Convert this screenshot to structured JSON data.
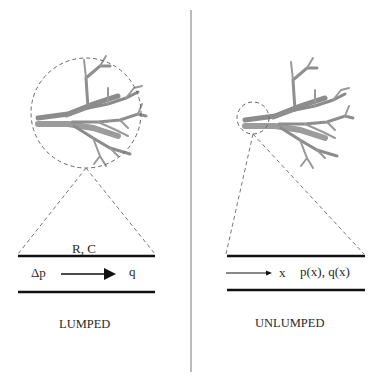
{
  "panels": {
    "lumped": {
      "title": "LUMPED",
      "tube_label": "R, C",
      "input_label": "Δp",
      "output_label": "q"
    },
    "unlumped": {
      "title": "UNLUMPED",
      "axis_label": "x",
      "variables_label": "p(x), q(x)"
    }
  },
  "icons": {
    "tree": "vascular-tree-illustration",
    "magnifier": "dashed-zoom-circle"
  },
  "colors": {
    "line": "#111111",
    "dashed": "#666666",
    "divider": "#777777",
    "vessel": "#9a9a9a"
  }
}
